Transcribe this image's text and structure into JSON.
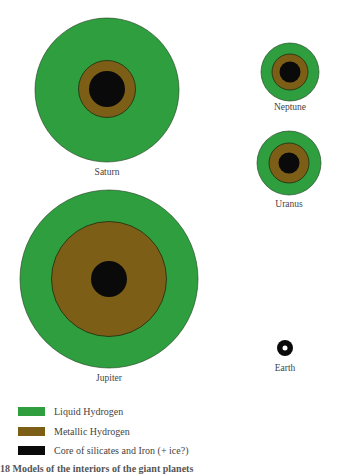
{
  "colors": {
    "liquid_hydrogen": "#2f9e3f",
    "metallic_hydrogen": "#7c5e16",
    "core": "#0a0a0a",
    "outline": "#1d3d1d"
  },
  "planets": [
    {
      "name": "Saturn",
      "cx": 107,
      "cy": 90,
      "r_outer": 72,
      "r_metallic": 28.5,
      "r_core": 18,
      "label_y": 175
    },
    {
      "name": "Neptune",
      "cx": 290,
      "cy": 72,
      "r_outer": 29,
      "r_metallic": 18,
      "r_core": 10.5,
      "label_y": 110
    },
    {
      "name": "Uranus",
      "cx": 289,
      "cy": 163,
      "r_outer": 32,
      "r_metallic": 20,
      "r_core": 10.5,
      "label_y": 207
    },
    {
      "name": "Jupiter",
      "cx": 109,
      "cy": 279,
      "r_outer": 89,
      "r_metallic": 57.5,
      "r_core": 18,
      "label_y": 381
    },
    {
      "name": "Earth",
      "cx": 285,
      "cy": 348,
      "r_core": 8,
      "r_inner_dot": 2.5,
      "label_y": 371
    }
  ],
  "legend": [
    {
      "label": "Liquid Hydrogen",
      "color": "#2f9e3f"
    },
    {
      "label": "Metallic Hydrogen",
      "color": "#7c5e16"
    },
    {
      "label": "Core of silicates and Iron (+ ice?)",
      "color": "#0a0a0a"
    }
  ],
  "caption": "18 Models of the interiors of the giant planets"
}
